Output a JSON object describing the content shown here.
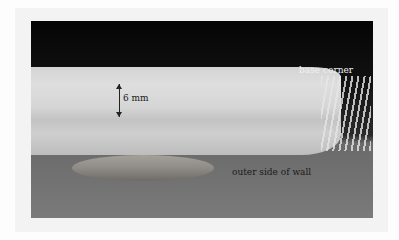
{
  "figure": {
    "type": "photograph",
    "labels": {
      "thickness": "6 mm",
      "base_corner": "base corner",
      "outer_side": "outer side of wall"
    }
  }
}
